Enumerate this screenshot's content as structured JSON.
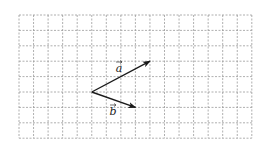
{
  "figure": {
    "grid": {
      "columns": 16,
      "rows": 8,
      "origin_px": [
        19,
        15
      ],
      "cell_w_px": 14.55,
      "cell_h_px": 15.4,
      "line_color": "#9a9a9a",
      "line_style": "dashed"
    },
    "common_origin_cell": [
      5,
      5
    ],
    "vectors": [
      {
        "name": "a",
        "label": "a",
        "label_has_arrow": true,
        "from_cell": [
          5,
          5
        ],
        "to_cell": [
          9,
          3
        ],
        "components": [
          4,
          2
        ],
        "label_pos_px": [
          119,
          72
        ],
        "color": "#1a1a1a"
      },
      {
        "name": "b",
        "label": "b",
        "label_has_arrow": true,
        "from_cell": [
          5,
          5
        ],
        "to_cell": [
          8,
          6
        ],
        "components": [
          3,
          -1
        ],
        "label_pos_px": [
          113,
          115
        ],
        "color": "#1a1a1a"
      }
    ]
  }
}
